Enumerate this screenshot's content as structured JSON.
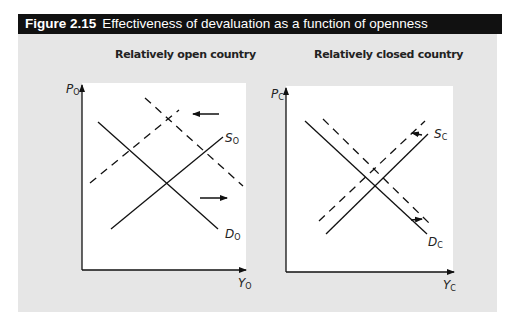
{
  "figure": {
    "number": "Figure 2.15",
    "title": "Effectiveness of devaluation as a function of openness"
  },
  "panels": [
    {
      "title": "Relatively open country",
      "y_axis_label": "P",
      "y_axis_sub": "O",
      "x_axis_label": "Y",
      "x_axis_sub": "O",
      "supply_label": "S",
      "supply_sub": "O",
      "demand_label": "D",
      "demand_sub": "O",
      "shift_size": "large",
      "arrows": [
        "supply-shift-left",
        "demand-shift-right"
      ]
    },
    {
      "title": "Relatively closed country",
      "y_axis_label": "P",
      "y_axis_sub": "C",
      "x_axis_label": "Y",
      "x_axis_sub": "C",
      "supply_label": "S",
      "supply_sub": "C",
      "demand_label": "D",
      "demand_sub": "C",
      "shift_size": "small",
      "arrows": [
        "supply-shift-left",
        "demand-shift-right"
      ]
    }
  ]
}
